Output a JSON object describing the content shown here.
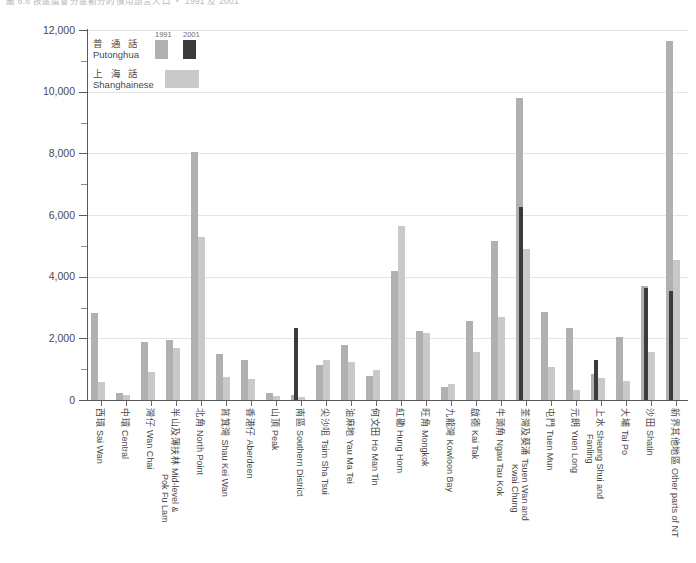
{
  "title": "圖 6.6 按區議會分區劃分的慣用語言人口 ‧ 1991 及 2001",
  "legend": {
    "years": [
      "1991",
      "2001"
    ],
    "series": [
      {
        "zh": "普 通 話",
        "en": "Putonghua",
        "color_1991": "#b0b0b0",
        "color_2001": "#3b3b3b"
      },
      {
        "zh": "上 海 話",
        "en": "Shanghainese",
        "color_1991": "#c9c9c9"
      }
    ]
  },
  "axis": {
    "y_ticks": [
      "0",
      "2,000",
      "4,000",
      "6,000",
      "8,000",
      "10,000",
      "12,000"
    ],
    "y_min": 0,
    "y_max": 12000,
    "y_major_step": 2000,
    "y_minor_step": 1000
  },
  "chart_data": {
    "type": "bar",
    "title": "圖 6.6 按區議會分區劃分的慣用語言人口 ‧ 1991 及 2001",
    "xlabel": "",
    "ylabel": "",
    "ylim": [
      0,
      12000
    ],
    "grid": true,
    "legend_position": "top-left",
    "categories": [
      "西環 Sai Wan",
      "中環 Central",
      "灣仔 Wan Chai",
      "半山及薄扶林 Mid-level & Pok Fu Lam",
      "北角 North Point",
      "筲箕灣 Shau Kei Wan",
      "香港仔 Aberdeen",
      "山頂 Peak",
      "南區 Southern District",
      "尖沙咀 Tsim Sha Tsui",
      "油麻地 Yau Ma Tei",
      "何文田 Ho Man Tin",
      "紅磡 Hung Hom",
      "旺角 Mongkok",
      "九龍灣 Kowloon Bay",
      "啟德 Kai Tak",
      "牛頭角 Ngau Tau Kok",
      "荃灣及葵涌 Tsuen Wan and Kwai Chung",
      "屯門 Tuen Mun",
      "元朗 Yuen Long",
      "上水 粉嶺 Sheung Shui and Fanling",
      "大埔 Tai Po",
      "沙田 Shatin",
      "新界其他地區 Other parts of NT"
    ],
    "series": [
      {
        "name": "Putonghua 1991",
        "color": "#b0b0b0",
        "values": [
          2820,
          230,
          1880,
          1960,
          8050,
          1500,
          1300,
          230,
          150,
          1150,
          1780,
          780,
          4200,
          2230,
          430,
          2550,
          5160,
          9800,
          2840,
          2330,
          860,
          2060,
          3700,
          11650
        ]
      },
      {
        "name": "Putonghua 2001",
        "color": "#3b3b3b",
        "values": [
          0,
          0,
          0,
          0,
          0,
          0,
          0,
          0,
          2330,
          0,
          0,
          0,
          0,
          0,
          0,
          0,
          0,
          6250,
          0,
          0,
          1300,
          0,
          3650,
          3550
        ]
      },
      {
        "name": "Shanghainese 1991",
        "color": "#c9c9c9",
        "values": [
          600,
          170,
          900,
          1700,
          5300,
          760,
          680,
          120,
          110,
          1290,
          1250,
          960,
          5640,
          2180,
          520,
          1560,
          2680,
          4900,
          1060,
          330,
          700,
          620,
          1550,
          4550
        ]
      }
    ]
  }
}
